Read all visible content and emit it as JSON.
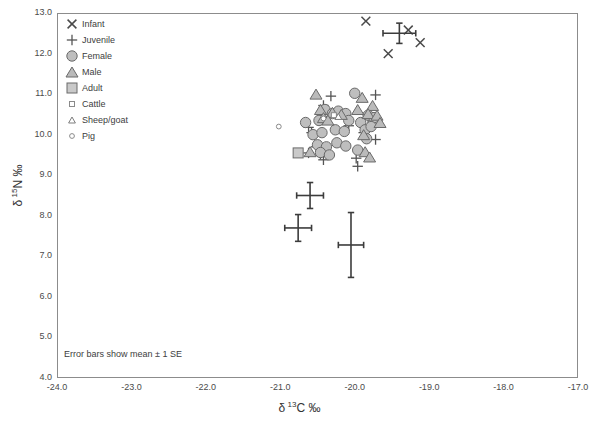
{
  "chart_data": {
    "type": "scatter",
    "title": "",
    "xlabel": "δ 13C ‰",
    "ylabel": "δ 15N ‰",
    "xlim": [
      -24.0,
      -17.0
    ],
    "ylim": [
      4.0,
      13.0
    ],
    "xticks": [
      "-24.0",
      "-23.0",
      "-22.0",
      "-21.0",
      "-20.0",
      "-19.0",
      "-18.0",
      "-17.0"
    ],
    "yticks": [
      "13.0",
      "12.0",
      "11.0",
      "10.0",
      "9.0",
      "8.0",
      "7.0",
      "6.0",
      "5.0",
      "4.0"
    ],
    "grid": false,
    "legend_position": "top-left",
    "annotation": "Error bars show mean ± 1 SE",
    "legend": [
      {
        "label": "Infant",
        "marker": "x",
        "size": "large"
      },
      {
        "label": "Juvenile",
        "marker": "plus",
        "size": "large"
      },
      {
        "label": "Female",
        "marker": "circle",
        "size": "large"
      },
      {
        "label": "Male",
        "marker": "triangle",
        "size": "large"
      },
      {
        "label": "Adult",
        "marker": "square",
        "size": "large"
      },
      {
        "label": "Cattle",
        "marker": "square",
        "size": "small"
      },
      {
        "label": "Sheep/goat",
        "marker": "triangle",
        "size": "small"
      },
      {
        "label": "Pig",
        "marker": "circle",
        "size": "small"
      }
    ],
    "series": [
      {
        "name": "Infant",
        "marker": "x",
        "size": "large",
        "points": [
          [
            -19.85,
            12.8
          ],
          [
            -19.28,
            12.58
          ],
          [
            -19.12,
            12.27
          ],
          [
            -19.55,
            12.0
          ]
        ]
      },
      {
        "name": "Juvenile",
        "marker": "plus",
        "size": "large",
        "points": [
          [
            -20.32,
            10.95
          ],
          [
            -20.42,
            10.72
          ],
          [
            -19.72,
            10.98
          ],
          [
            -20.62,
            10.18
          ],
          [
            -20.58,
            10.05
          ],
          [
            -20.44,
            10.45
          ],
          [
            -20.08,
            10.22
          ],
          [
            -19.82,
            10.4
          ],
          [
            -19.88,
            10.05
          ],
          [
            -19.72,
            9.88
          ],
          [
            -20.62,
            9.55
          ],
          [
            -20.46,
            9.52
          ],
          [
            -20.42,
            9.38
          ],
          [
            -19.98,
            9.42
          ],
          [
            -19.96,
            9.22
          ],
          [
            -20.52,
            9.7
          ]
        ]
      },
      {
        "name": "Female",
        "marker": "circle",
        "size": "large",
        "points": [
          [
            -20.0,
            11.02
          ],
          [
            -20.4,
            10.62
          ],
          [
            -20.3,
            10.52
          ],
          [
            -20.22,
            10.58
          ],
          [
            -20.12,
            10.52
          ],
          [
            -19.82,
            10.48
          ],
          [
            -19.74,
            10.42
          ],
          [
            -20.66,
            10.3
          ],
          [
            -20.48,
            10.35
          ],
          [
            -20.08,
            10.35
          ],
          [
            -19.92,
            10.3
          ],
          [
            -20.56,
            10.0
          ],
          [
            -20.44,
            10.05
          ],
          [
            -20.26,
            10.12
          ],
          [
            -20.14,
            10.08
          ],
          [
            -19.86,
            10.12
          ],
          [
            -19.78,
            10.2
          ],
          [
            -20.5,
            9.75
          ],
          [
            -20.38,
            9.7
          ],
          [
            -20.24,
            9.8
          ],
          [
            -20.12,
            9.72
          ],
          [
            -19.96,
            9.62
          ],
          [
            -19.84,
            9.9
          ],
          [
            -20.46,
            9.56
          ],
          [
            -20.34,
            9.5
          ]
        ]
      },
      {
        "name": "Male",
        "marker": "triangle",
        "size": "large",
        "points": [
          [
            -20.52,
            11.0
          ],
          [
            -19.9,
            10.92
          ],
          [
            -20.46,
            10.62
          ],
          [
            -19.96,
            10.62
          ],
          [
            -19.76,
            10.72
          ],
          [
            -20.3,
            10.55
          ],
          [
            -20.18,
            10.5
          ],
          [
            -19.82,
            10.52
          ],
          [
            -19.7,
            10.48
          ],
          [
            -19.66,
            10.3
          ],
          [
            -20.42,
            10.42
          ],
          [
            -20.36,
            10.36
          ],
          [
            -19.88,
            10.0
          ],
          [
            -20.6,
            9.58
          ],
          [
            -19.86,
            9.58
          ],
          [
            -19.8,
            9.45
          ]
        ]
      },
      {
        "name": "Adult",
        "marker": "square",
        "size": "large",
        "points": [
          [
            -20.76,
            9.55
          ]
        ]
      },
      {
        "name": "Cattle",
        "marker": "square",
        "size": "small",
        "points": [
          [
            -20.28,
            10.48
          ]
        ]
      },
      {
        "name": "Sheep/goat",
        "marker": "triangle",
        "size": "small",
        "points": [
          [
            -20.22,
            10.45
          ]
        ]
      },
      {
        "name": "Pig",
        "marker": "circle",
        "size": "small",
        "points": [
          [
            -21.02,
            10.2
          ],
          [
            -20.42,
            10.4
          ]
        ]
      }
    ],
    "error_bars": [
      {
        "group": "Infant",
        "x": -19.4,
        "y": 12.5,
        "xerr": 0.22,
        "yerr": 0.25
      },
      {
        "group": "Adult",
        "x": -20.6,
        "y": 8.5,
        "xerr": 0.18,
        "yerr": 0.32
      },
      {
        "group": "Juvenile",
        "x": -20.76,
        "y": 7.7,
        "xerr": 0.18,
        "yerr": 0.33
      },
      {
        "group": "Child",
        "x": -20.05,
        "y": 7.28,
        "xerr": 0.17,
        "yerr": 0.8
      }
    ]
  }
}
